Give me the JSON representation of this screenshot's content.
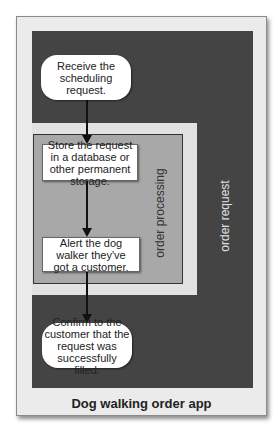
{
  "diagram": {
    "title": "Dog walking order app",
    "containers": {
      "outer_label": "order request",
      "inner_label": "order processing"
    },
    "nodes": [
      {
        "id": "receive",
        "shape": "rounded",
        "text": "Receive the scheduling request."
      },
      {
        "id": "store",
        "shape": "rect",
        "text": "Store the request in a database or other permanent storage."
      },
      {
        "id": "alert",
        "shape": "rect",
        "text": "Alert the dog walker they've got a customer."
      },
      {
        "id": "confirm",
        "shape": "rounded",
        "text": "Confirm to the customer that the request was successfully filled."
      }
    ],
    "edges": [
      {
        "from": "receive",
        "to": "store"
      },
      {
        "from": "store",
        "to": "alert"
      },
      {
        "from": "alert",
        "to": "confirm"
      }
    ],
    "colors": {
      "outer_panel": "#444444",
      "frame": "#e2e2e2",
      "processing": "#a8a8a8",
      "node": "#ffffff"
    }
  }
}
